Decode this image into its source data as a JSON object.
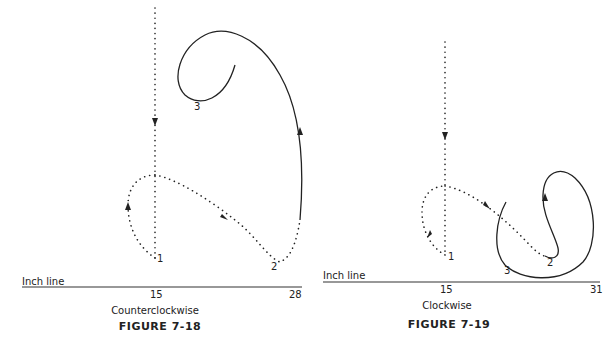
{
  "figures": [
    {
      "id": "7-18",
      "title": "FIGURE 7-18",
      "direction": "Counterclockwise",
      "axis_label": "Inch line",
      "ticks": [
        "15",
        "28"
      ],
      "points": [
        "1",
        "2",
        "3"
      ]
    },
    {
      "id": "7-19",
      "title": "FIGURE 7-19",
      "direction": "Clockwise",
      "axis_label": "Inch line",
      "ticks": [
        "15",
        "31"
      ],
      "points": [
        "1",
        "2",
        "3"
      ]
    }
  ]
}
